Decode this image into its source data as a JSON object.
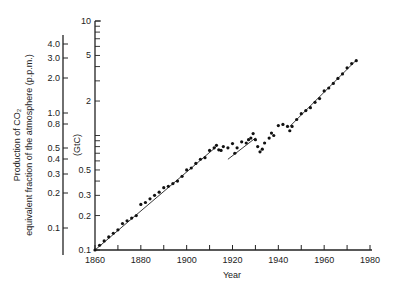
{
  "chart_data": {
    "type": "scatter",
    "title": "",
    "xlabel": "Year",
    "ylabel_left": "Production of CO2 equivalent fraction of the atmosphere (p.p.m.)",
    "ylabel_left_line1": "Production of CO₂",
    "ylabel_left_line2": "equivalent fraction of the atmosphere (p.p.m.)",
    "ylabel_inner": "(GtC)",
    "xlim": [
      1860,
      1980
    ],
    "ylim_inner": [
      0.1,
      10
    ],
    "yscale": "log",
    "grid": false,
    "legend": null,
    "x_ticks": [
      1860,
      1880,
      1900,
      1920,
      1940,
      1960,
      1980
    ],
    "x_minor_ticks": [
      1870,
      1890,
      1910,
      1930,
      1950,
      1970
    ],
    "inner_axis_ticks": [
      {
        "value": 10,
        "label": "10"
      },
      {
        "value": 5,
        "label": "5"
      },
      {
        "value": 2,
        "label": "2"
      },
      {
        "value": 0.5,
        "label": "0.5"
      },
      {
        "value": 0.3,
        "label": "0.3"
      },
      {
        "value": 0.2,
        "label": "0.2"
      },
      {
        "value": 0.1,
        "label": "0.1"
      }
    ],
    "outer_axis_ticks": [
      {
        "label": "4.0",
        "py": 44
      },
      {
        "label": "3.0",
        "py": 58
      },
      {
        "label": "2.0",
        "py": 78
      },
      {
        "label": "1.0",
        "py": 113
      },
      {
        "label": "0.8",
        "py": 124
      },
      {
        "label": "0.5",
        "py": 148
      },
      {
        "label": "0.4",
        "py": 159
      },
      {
        "label": "0.3",
        "py": 174
      },
      {
        "label": "0.2",
        "py": 193
      },
      {
        "label": "0.1",
        "py": 228
      }
    ],
    "series": [
      {
        "name": "CO2 production (GtC)",
        "style": "dots",
        "x": [
          1860,
          1862,
          1864,
          1866,
          1868,
          1870,
          1872,
          1874,
          1876,
          1878,
          1880,
          1882,
          1884,
          1886,
          1888,
          1890,
          1892,
          1894,
          1896,
          1898,
          1900,
          1902,
          1904,
          1906,
          1908,
          1910,
          1912,
          1913,
          1914,
          1915,
          1916,
          1918,
          1920,
          1921,
          1922,
          1924,
          1926,
          1927,
          1928,
          1929,
          1930,
          1931,
          1932,
          1933,
          1934,
          1936,
          1937,
          1938,
          1940,
          1942,
          1944,
          1945,
          1946,
          1948,
          1950,
          1952,
          1954,
          1956,
          1958,
          1960,
          1962,
          1964,
          1966,
          1968,
          1970,
          1972,
          1974
        ],
        "values": [
          0.1,
          0.11,
          0.12,
          0.13,
          0.14,
          0.15,
          0.17,
          0.18,
          0.19,
          0.2,
          0.25,
          0.26,
          0.28,
          0.3,
          0.32,
          0.35,
          0.36,
          0.38,
          0.4,
          0.44,
          0.5,
          0.52,
          0.57,
          0.62,
          0.64,
          0.74,
          0.78,
          0.82,
          0.75,
          0.74,
          0.8,
          0.78,
          0.85,
          0.7,
          0.78,
          0.88,
          0.86,
          0.92,
          0.95,
          1.04,
          0.92,
          0.8,
          0.72,
          0.76,
          0.86,
          0.95,
          1.05,
          1.0,
          1.22,
          1.25,
          1.2,
          1.1,
          1.2,
          1.38,
          1.55,
          1.65,
          1.75,
          1.95,
          2.1,
          2.45,
          2.6,
          2.85,
          3.15,
          3.45,
          3.9,
          4.25,
          4.5
        ]
      },
      {
        "name": "Exponential fit",
        "style": "line",
        "x": [
          1860,
          1913
        ],
        "values": [
          0.1,
          0.8
        ]
      },
      {
        "name": "Exponential fit 2",
        "style": "line",
        "x": [
          1918,
          1930
        ],
        "values": [
          0.62,
          0.95
        ]
      },
      {
        "name": "Exponential fit 3",
        "style": "line",
        "x": [
          1945,
          1974
        ],
        "values": [
          1.2,
          4.55
        ]
      }
    ]
  },
  "layout": {
    "plot_left": 95,
    "plot_right": 370,
    "plot_bottom": 250,
    "plot_top": 21,
    "outer_axis_x": 63,
    "outer_axis_top": 35,
    "outer_axis_bottom": 255,
    "x_tick_px_per_year": 2.2917,
    "y_px_per_decade": 114.5,
    "y_at_1": 135.5
  }
}
